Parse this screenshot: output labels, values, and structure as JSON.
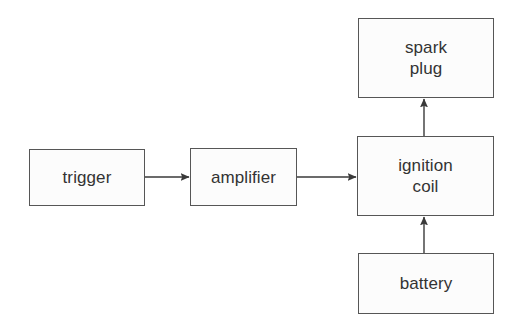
{
  "diagram": {
    "background_color": "#ffffff",
    "node_fill_color": "#fcfcfc",
    "node_stroke_color": "#565656",
    "text_color": "#333333",
    "edge_color": "#3a3a3a",
    "nodes": [
      {
        "id": "trigger",
        "label": "trigger",
        "x": 29,
        "y": 149,
        "w": 116,
        "h": 57
      },
      {
        "id": "amplifier",
        "label": "amplifier",
        "x": 190,
        "y": 148,
        "w": 107,
        "h": 58
      },
      {
        "id": "ignition-coil",
        "label": "ignition\ncoil",
        "x": 357,
        "y": 136,
        "w": 137,
        "h": 80
      },
      {
        "id": "spark-plug",
        "label": "spark\nplug",
        "x": 358,
        "y": 18,
        "w": 136,
        "h": 80
      },
      {
        "id": "battery",
        "label": "battery",
        "x": 358,
        "y": 253,
        "w": 136,
        "h": 61
      }
    ],
    "edges": [
      {
        "id": "trigger-to-amplifier",
        "from": "trigger",
        "to": "amplifier",
        "direction": "right",
        "x1": 145,
        "y1": 177,
        "x2": 190,
        "y2": 177
      },
      {
        "id": "amplifier-to-ignition-coil",
        "from": "amplifier",
        "to": "ignition-coil",
        "direction": "right",
        "x1": 297,
        "y1": 177,
        "x2": 357,
        "y2": 177
      },
      {
        "id": "ignition-coil-to-spark-plug",
        "from": "ignition-coil",
        "to": "spark-plug",
        "direction": "up",
        "x1": 424,
        "y1": 136,
        "x2": 424,
        "y2": 98
      },
      {
        "id": "battery-to-ignition-coil",
        "from": "battery",
        "to": "ignition-coil",
        "direction": "up",
        "x1": 424,
        "y1": 253,
        "x2": 424,
        "y2": 216
      }
    ]
  }
}
